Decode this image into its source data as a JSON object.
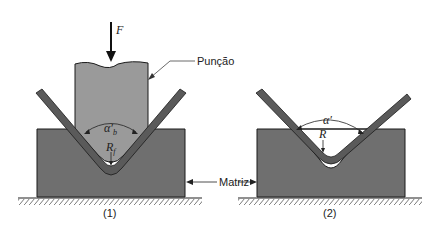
{
  "diagram": {
    "force_label": "F",
    "punch_label": "Punção",
    "die_label": "Matriz",
    "stage1": {
      "caption": "(1)",
      "angle_label": "α′b",
      "angle_main": "α′",
      "angle_sub": "b",
      "radius_label": "Rf",
      "radius_main": "R",
      "radius_sub": "f"
    },
    "stage2": {
      "caption": "(2)",
      "angle_label": "α′",
      "radius_label": "R"
    },
    "colors": {
      "punch": "#9a9a9a",
      "die": "#6f6f6f",
      "sheet": "#5a5a5a",
      "outline": "#1a1a1a",
      "background": "#ffffff"
    }
  }
}
